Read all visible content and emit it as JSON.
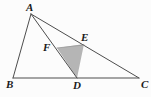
{
  "figure": {
    "type": "geometry-diagram",
    "background_color": "#fcfcfc",
    "stroke_color": "#4d4d4d",
    "label_color": "#1a1a1a",
    "shade_color": "#b5b5b5",
    "canvas": {
      "width": 151,
      "height": 97
    },
    "points": {
      "A": {
        "label": "A",
        "x": 31,
        "y": 14,
        "label_x": 26,
        "label_y": 2
      },
      "B": {
        "label": "B",
        "x": 13,
        "y": 78,
        "label_x": 6,
        "label_y": 79
      },
      "C": {
        "label": "C",
        "x": 139,
        "y": 78,
        "label_x": 141,
        "label_y": 79
      },
      "D": {
        "label": "D",
        "x": 77,
        "y": 78,
        "label_x": 73,
        "label_y": 80
      },
      "E": {
        "label": "E",
        "x": 84,
        "y": 45,
        "label_x": 81,
        "label_y": 32
      },
      "F": {
        "label": "F",
        "x": 57,
        "y": 48,
        "label_x": 43,
        "label_y": 42
      }
    },
    "segments": [
      {
        "name": "AB",
        "from": "A",
        "to": "B"
      },
      {
        "name": "BC",
        "from": "B",
        "to": "C"
      },
      {
        "name": "AC",
        "from": "A",
        "to": "C"
      },
      {
        "name": "AD",
        "from": "A",
        "to": "D"
      },
      {
        "name": "AE",
        "from": "A",
        "to": "E"
      },
      {
        "name": "FE",
        "from": "F",
        "to": "E"
      }
    ],
    "shaded_polygon": {
      "name": "triangle-FED",
      "vertices": [
        "F",
        "E",
        "D"
      ],
      "points": "57,48 84,44 77,78"
    }
  }
}
